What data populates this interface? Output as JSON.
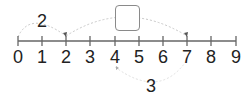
{
  "number_line": {
    "ticks": [
      "0",
      "1",
      "2",
      "3",
      "4",
      "5",
      "6",
      "7",
      "8",
      "9"
    ],
    "axis_color": "#666666"
  },
  "jumps": {
    "first": {
      "label": "2",
      "from": 0,
      "to": 2,
      "side": "above"
    },
    "second": {
      "label": "",
      "from": 2,
      "to": 7,
      "side": "above",
      "unknown_box": true
    },
    "third": {
      "label": "3",
      "from": 4,
      "to": 7,
      "side": "below"
    }
  },
  "answer_box": {
    "value": ""
  }
}
